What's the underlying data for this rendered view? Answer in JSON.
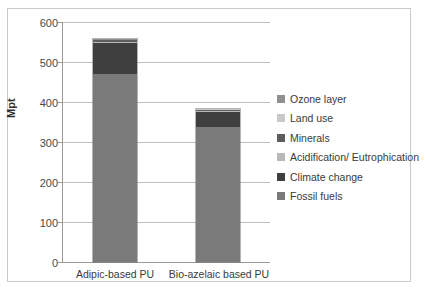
{
  "chart_data": {
    "type": "bar",
    "subtype": "stacked-column",
    "title": "",
    "xlabel": "",
    "ylabel": "Mpt",
    "ylim": [
      0,
      600
    ],
    "ytick_step": 100,
    "yticks": [
      "0",
      "100",
      "200",
      "300",
      "400",
      "500",
      "600"
    ],
    "grid": "horizontal",
    "legend_position": "right",
    "categories": [
      "Adipic-based PU",
      "Bio-azelaic based PU"
    ],
    "series": [
      {
        "name": "Fossil fuels",
        "color": "#7a7a7a",
        "values": [
          470,
          338
        ]
      },
      {
        "name": "Climate change",
        "color": "#3f3f3f",
        "values": [
          78,
          36
        ]
      },
      {
        "name": "Acidification/ Eutrophication",
        "color": "#b9b9b9",
        "values": [
          3,
          3
        ]
      },
      {
        "name": "Minerals",
        "color": "#5e5e5e",
        "values": [
          3,
          3
        ]
      },
      {
        "name": "Land use",
        "color": "#c9c9c9",
        "values": [
          1.5,
          1.5
        ]
      },
      {
        "name": "Ozone layer",
        "color": "#8f8f8f",
        "values": [
          1.5,
          1.5
        ]
      }
    ],
    "totals": [
      557,
      383
    ],
    "legend_order": [
      "Ozone layer",
      "Land use",
      "Minerals",
      "Acidification/ Eutrophication",
      "Climate change",
      "Fossil fuels"
    ]
  },
  "legend": {
    "items": [
      {
        "label": "Ozone layer",
        "color": "#8f8f8f"
      },
      {
        "label": "Land use",
        "color": "#c9c9c9"
      },
      {
        "label": "Minerals",
        "color": "#5e5e5e"
      },
      {
        "label": "Acidification/ Eutrophication",
        "color": "#b9b9b9"
      },
      {
        "label": "Climate change",
        "color": "#3f3f3f"
      },
      {
        "label": "Fossil fuels",
        "color": "#7a7a7a"
      }
    ]
  },
  "axis": {
    "y_title": "Mpt",
    "y_labels": [
      "600",
      "500",
      "400",
      "300",
      "200",
      "100",
      "0"
    ],
    "x_labels": [
      "Adipic-based PU",
      "Bio-azelaic based PU"
    ]
  }
}
